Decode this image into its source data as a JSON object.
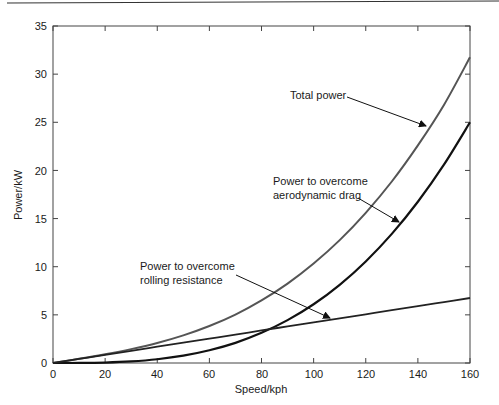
{
  "chart_data": {
    "type": "line",
    "title": "",
    "xlabel": "Speed/kph",
    "ylabel": "Power/kW",
    "xlim": [
      0,
      160
    ],
    "ylim": [
      0,
      35
    ],
    "xticks": [
      0,
      20,
      40,
      60,
      80,
      100,
      120,
      140,
      160
    ],
    "yticks": [
      0,
      5,
      10,
      15,
      20,
      25,
      30,
      35
    ],
    "grid": false,
    "legend": "none (inline annotations with arrows)",
    "x": [
      0,
      10,
      20,
      30,
      40,
      50,
      60,
      70,
      80,
      90,
      100,
      110,
      120,
      130,
      140,
      150,
      160
    ],
    "series": [
      {
        "name": "Total power",
        "color": "#555555",
        "values": [
          0,
          0.43,
          0.9,
          1.44,
          2.08,
          2.87,
          3.84,
          5.03,
          6.5,
          8.25,
          10.33,
          12.76,
          15.6,
          18.85,
          22.6,
          26.8,
          31.75
        ]
      },
      {
        "name": "Power to overcome aerodynamic drag",
        "color": "#111111",
        "values": [
          0,
          0.006,
          0.049,
          0.165,
          0.39,
          0.76,
          1.32,
          2.09,
          3.13,
          4.45,
          6.1,
          8.12,
          10.55,
          13.41,
          16.75,
          20.6,
          25.0
        ]
      },
      {
        "name": "Power to overcome rolling resistance",
        "color": "#222222",
        "values": [
          0,
          0.42,
          0.84,
          1.27,
          1.69,
          2.11,
          2.53,
          2.95,
          3.38,
          3.8,
          4.22,
          4.64,
          5.06,
          5.48,
          5.91,
          6.33,
          6.75
        ]
      }
    ],
    "annotations": [
      {
        "text": "Total power",
        "points_to": "Total power"
      },
      {
        "text": [
          "Power to overcome",
          "aerodynamic drag"
        ],
        "points_to": "Power to overcome aerodynamic drag"
      },
      {
        "text": [
          "Power to overcome",
          "rolling resistance"
        ],
        "points_to": "Power to overcome rolling resistance"
      }
    ]
  },
  "labels": {
    "xlabel": "Speed/kph",
    "ylabel": "Power/kW",
    "total": "Total power",
    "drag_1": "Power to overcome",
    "drag_2": "aerodynamic drag",
    "roll_1": "Power to overcome",
    "roll_2": "rolling resistance",
    "x0": "0",
    "x20": "20",
    "x40": "40",
    "x60": "60",
    "x80": "80",
    "x100": "100",
    "x120": "120",
    "x140": "140",
    "x160": "160",
    "y0": "0",
    "y5": "5",
    "y10": "10",
    "y15": "15",
    "y20": "20",
    "y25": "25",
    "y30": "30",
    "y35": "35"
  }
}
